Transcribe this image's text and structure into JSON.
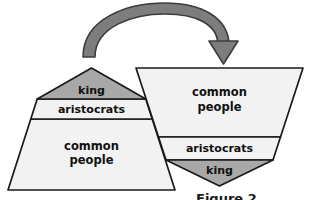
{
  "figure": {
    "background_color": "#ffffff"
  },
  "colors": {
    "stroke": "#1a1a1a",
    "light_fill": "#f2f2f2",
    "king_fill": "#a8a8a8",
    "arrow_fill": "#7d7d7d",
    "arrow_stroke": "#3c3c3c",
    "text": "#111111"
  },
  "left_pyramid": {
    "name": "upright-pyramid",
    "orientation": "upright",
    "tiers": [
      {
        "id": "king",
        "label": "king",
        "position": "top",
        "fill": "#a8a8a8"
      },
      {
        "id": "aristocrats",
        "label": "aristocrats",
        "position": "middle",
        "fill": "#f2f2f2"
      },
      {
        "id": "common-people",
        "label": "common\npeople",
        "line1": "common",
        "line2": "people",
        "position": "bottom",
        "fill": "#f2f2f2"
      }
    ]
  },
  "right_pyramid": {
    "name": "inverted-pyramid",
    "orientation": "inverted",
    "tiers": [
      {
        "id": "common-people",
        "label": "common\npeople",
        "line1": "common",
        "line2": "people",
        "position": "top",
        "fill": "#f2f2f2"
      },
      {
        "id": "aristocrats",
        "label": "aristocrats",
        "position": "middle",
        "fill": "#f2f2f2"
      },
      {
        "id": "king",
        "label": "king",
        "position": "bottom",
        "fill": "#a8a8a8"
      }
    ]
  },
  "arrow": {
    "name": "curved-transformation-arrow",
    "shape": "curved-arc",
    "direction": "left-to-right",
    "head": "down",
    "fill": "#7d7d7d"
  },
  "caption": {
    "text": "Figure 2",
    "visible_fragment": "Figure 2"
  }
}
